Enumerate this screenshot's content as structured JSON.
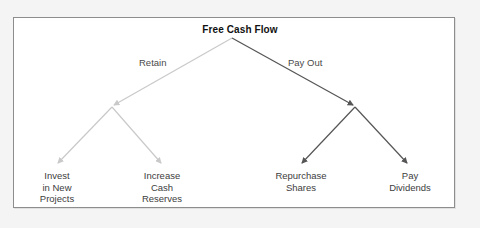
{
  "diagram": {
    "title": "Free Cash Flow",
    "root": {
      "label": "Free Cash Flow",
      "x": 232,
      "y": 38
    },
    "branches": [
      {
        "name": "retain",
        "label": "Retain",
        "color": "#c9c9c9",
        "junction": {
          "x": 112,
          "y": 107
        }
      },
      {
        "name": "pay-out",
        "label": "Pay Out",
        "color": "#555555",
        "junction": {
          "x": 355,
          "y": 107
        }
      }
    ],
    "leaves": [
      {
        "name": "invest-in-new-projects",
        "label": "Invest\nin New\nProjects",
        "branch": "retain",
        "color": "#c9c9c9",
        "tip": {
          "x": 57,
          "y": 165
        }
      },
      {
        "name": "increase-cash-reserves",
        "label": "Increase\nCash\nReserves",
        "branch": "retain",
        "color": "#c9c9c9",
        "tip": {
          "x": 162,
          "y": 165
        }
      },
      {
        "name": "repurchase-shares",
        "label": "Repurchase\nShares",
        "branch": "pay-out",
        "color": "#555555",
        "tip": {
          "x": 301,
          "y": 165
        }
      },
      {
        "name": "pay-dividends",
        "label": "Pay\nDividends",
        "branch": "pay-out",
        "color": "#555555",
        "tip": {
          "x": 408,
          "y": 165
        }
      }
    ],
    "colors": {
      "frame_border": "#8d8d8d",
      "frame_background": "#ffffff",
      "page_background": "#f4f4f4",
      "title_text": "#111111",
      "label_text": "#3d3d3d",
      "edge_label_text": "#4a4a4a",
      "light_edge": "#c9c9c9",
      "dark_edge": "#555555"
    }
  }
}
